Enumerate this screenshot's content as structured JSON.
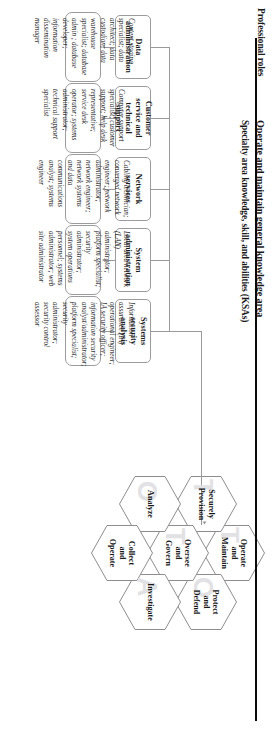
{
  "figure": {
    "row_labels": {
      "main_title": "Operate and maintain general knowledge area",
      "ksa_row": "Specialty area knowledge, skill, and abilities (KSAs)",
      "roles_row": "Professional roles"
    },
    "colors": {
      "text": "#19191a",
      "box_border": "#9c9c9f",
      "connector": "#9a9a9d",
      "hexagon_border": "#8d8d90",
      "page_rule": "#0a0a0a",
      "background": "#ffffff"
    },
    "specialty_areas": [
      {
        "label": "Data administration"
      },
      {
        "label": "Customer service and technical support"
      },
      {
        "label": "Network services"
      },
      {
        "label": "System administration"
      },
      {
        "label": "Systems security analysis"
      }
    ],
    "professional_roles": [
      {
        "label": "Content staging specialist; data architect; data custodian; data warehouse specialist; database admin ; database developer; information dissemination manager"
      },
      {
        "label": "Computer support specialist; customer support; help desk representative; service desk operator; systems administrator; technical support specialist"
      },
      {
        "label": "Cabling technician; converged network engineer; network administrator; network engineer; network systems and data communications analyst; systems engineer"
      },
      {
        "label": "Local area network (LAN) administrator; platform specialist; security administrator; system operations personnel; systems administrator; web site administrator"
      },
      {
        "label": "Information assurance (IA) operational engineer; IA security officer; information security analyst/administrator; platform specialist; security administrator; security control assessor"
      }
    ],
    "categories": [
      {
        "label": "Protect and Defend",
        "lines": [
          "Protect",
          "and",
          "Defend"
        ]
      },
      {
        "label": "Investigate",
        "lines": [
          "Investigate"
        ]
      },
      {
        "label": "Operate and Maintain",
        "lines": [
          "Operate",
          "and",
          "Maintain"
        ]
      },
      {
        "label": "Oversee and Govern",
        "lines": [
          "Oversee",
          "and",
          "Govern"
        ]
      },
      {
        "label": "Collect and Operate",
        "lines": [
          "Collect",
          "and",
          "Operate"
        ]
      },
      {
        "label": "Securely Provision",
        "lines": [
          "Securely",
          "Provision"
        ]
      },
      {
        "label": "Analyze",
        "lines": [
          "Analyze"
        ]
      }
    ]
  }
}
